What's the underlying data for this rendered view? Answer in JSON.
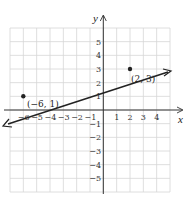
{
  "chart_data": {
    "type": "line",
    "title": "",
    "xlabel": "x",
    "ylabel": "y",
    "xlim": [
      -7,
      5
    ],
    "ylim": [
      -6,
      6
    ],
    "grid": true,
    "x_ticks": [
      "-6",
      "-5",
      "-4",
      "-3",
      "-2",
      "-1",
      "1",
      "2",
      "3",
      "4"
    ],
    "y_ticks": [
      "5",
      "4",
      "3",
      "2",
      "1",
      "-1",
      "-2",
      "-3",
      "-4",
      "-5"
    ],
    "series": [
      {
        "name": "line through (-6,1) and (2,3)",
        "x": [
          -7,
          5
        ],
        "y": [
          0.75,
          3.75
        ],
        "arrows": "both"
      }
    ],
    "points": [
      {
        "x": -6,
        "y": 1,
        "label": "(−6, 1)"
      },
      {
        "x": 2,
        "y": 3,
        "label": "(2, 3)"
      }
    ]
  },
  "labels": {
    "x_axis": "x",
    "y_axis": "y",
    "point_a": "(−6, 1)",
    "point_b": "(2, 3)",
    "x_ticks": [
      "−6",
      "−5",
      "−4",
      "−3",
      "−2",
      "−1",
      "1",
      "2",
      "3",
      "4"
    ],
    "y_ticks_pos": [
      "5",
      "4",
      "3",
      "2",
      "1"
    ],
    "y_ticks_neg": [
      "−1",
      "−2",
      "−3",
      "−4",
      "−5"
    ]
  }
}
